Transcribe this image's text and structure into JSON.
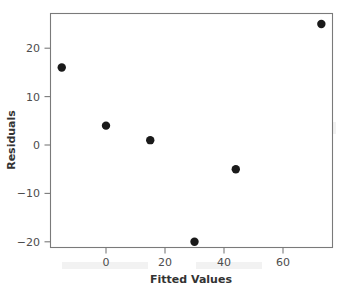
{
  "chart_data": {
    "type": "scatter",
    "title": "",
    "xlabel": "Fitted Values",
    "ylabel": "Residuals",
    "x": [
      -15,
      0,
      15,
      30,
      44,
      73
    ],
    "y": [
      16,
      4,
      1,
      -20,
      -5,
      25
    ],
    "points": [
      {
        "x": -15,
        "y": 16
      },
      {
        "x": 0,
        "y": 4
      },
      {
        "x": 15,
        "y": 1
      },
      {
        "x": 30,
        "y": -20
      },
      {
        "x": 44,
        "y": -5
      },
      {
        "x": 73,
        "y": 25
      }
    ],
    "xticks": [
      0,
      20,
      40,
      60
    ],
    "xtick_labels": [
      "0",
      "20",
      "40",
      "60"
    ],
    "yticks": [
      20,
      10,
      0,
      -10,
      -20
    ],
    "ytick_labels": [
      "20",
      "10",
      "0",
      "−10",
      "−20"
    ],
    "xlim": [
      -19,
      77
    ],
    "ylim": [
      -21.2,
      27.2
    ],
    "grid": false,
    "legend": null,
    "marker": "filled-circle",
    "marker_color": "#1a1a1a",
    "marker_size": 4,
    "frame_color": "#7a7a7a",
    "background_color": "#ffffff"
  },
  "axes": {
    "x_title": "Fitted Values",
    "y_title": "Residuals"
  }
}
